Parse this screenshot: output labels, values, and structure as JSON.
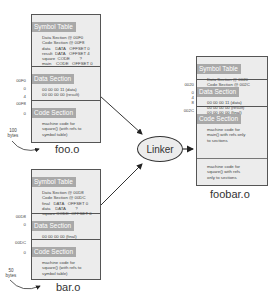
{
  "foo": {
    "name": "foo.o",
    "size": "100",
    "size_unit": "bytes",
    "symbol_table": {
      "title": "Symbol Table",
      "lines": [
        "Data Section @ 00F0",
        "Code Section @ 00F8",
        "data    DATA   OFFSET 0",
        "result  DATA   OFFSET 4",
        "square  CODE        ?",
        "main    CODE   OFFSET 0"
      ]
    },
    "data_section": {
      "title": "Data Section",
      "lines": [
        "00 00 00 11 (data)",
        "00 00 00 00 (result)"
      ],
      "addrs": [
        "00F0",
        "0",
        "4"
      ]
    },
    "code_section": {
      "title": "Code Section",
      "lines": [
        "machine code for",
        "square() (with refs to",
        "symbol table)"
      ],
      "addrs": [
        "00F8",
        "0"
      ]
    }
  },
  "bar": {
    "name": "bar.o",
    "size": "50",
    "size_unit": "bytes",
    "symbol_table": {
      "title": "Symbol Table",
      "lines": [
        "Data Section @ 00D8",
        "Code Section @ 00DC",
        "final   DATA   OFFSET 0",
        "data    DATA        ?",
        "square CODE  OFFSET 0"
      ]
    },
    "data_section": {
      "title": "Data Section",
      "lines": [
        "00 00 00 00 (final)"
      ],
      "addrs": [
        "00D8",
        "0"
      ]
    },
    "code_section": {
      "title": "Code Section",
      "lines": [
        "machine code for",
        "square() (with refs to",
        "symbol table)"
      ],
      "addrs": [
        "00DC",
        "0"
      ]
    }
  },
  "linker": {
    "label": "Linker"
  },
  "foobar": {
    "name": "foobar.o",
    "symbol_table": {
      "title": "Symbol Table",
      "lines": [
        "Data Section @ 0020",
        "Code Section @ 002C"
      ]
    },
    "data_section": {
      "title": "Data Section",
      "lines": [
        "00 00 00 11 (data)",
        "00 00 00 00 (result)",
        "00 00 00 00 (final)"
      ],
      "addrs": [
        "0020",
        "0",
        "4",
        "8"
      ]
    },
    "code_section": {
      "title": "Code Section",
      "main_lines": [
        "machine code for",
        "main() with refs only",
        "to sections"
      ],
      "square_lines": [
        "machine code for",
        "square() with refs",
        "only to sections"
      ],
      "addrs": [
        "002C"
      ]
    }
  },
  "colors": {
    "header_bg": "#a9a9a9",
    "box_bg": "#ececec",
    "border": "#555555"
  }
}
